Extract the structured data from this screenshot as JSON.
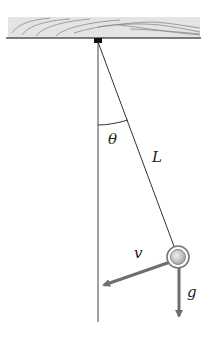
{
  "diagram": {
    "type": "simple-pendulum",
    "labels": {
      "angle": "θ",
      "length": "L",
      "velocity": "v",
      "gravity": "g"
    },
    "colors": {
      "board_fill": "#e4e4e4",
      "board_grain": "#8a8a8a",
      "board_edge": "#555555",
      "pivot": "#111111",
      "string": "#333333",
      "vertical_ref": "#444444",
      "vector": "#6e6e6e",
      "bob_outer": "#777777",
      "bob_inner": "#cfcfcf"
    }
  }
}
